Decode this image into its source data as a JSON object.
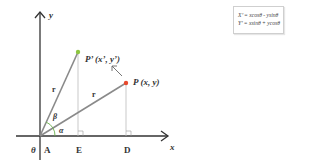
{
  "diagram": {
    "axes": {
      "x_label": "x",
      "y_label": "y",
      "origin_label": "θ"
    },
    "points": {
      "P": {
        "label": "P (x, y)",
        "color": "#e8492e"
      },
      "P_prime": {
        "label": "P’ (x’, y’)",
        "color": "#8dc63f"
      }
    },
    "segments": {
      "r1": "r",
      "r2": "r"
    },
    "angles": {
      "alpha": "α",
      "beta": "β"
    },
    "feet": {
      "A": "A",
      "E": "E",
      "D": "D"
    },
    "rotation_arrow": "rotate-counterclockwise"
  },
  "formulas": [
    "X’ = xcosθ - ysinθ",
    "Y’ = xsinθ + ycosθ"
  ],
  "colors": {
    "axis": "#333333",
    "radius": "#8a8a8a",
    "projection": "#b5b5b5",
    "angle_arc": "#6ab04c"
  }
}
